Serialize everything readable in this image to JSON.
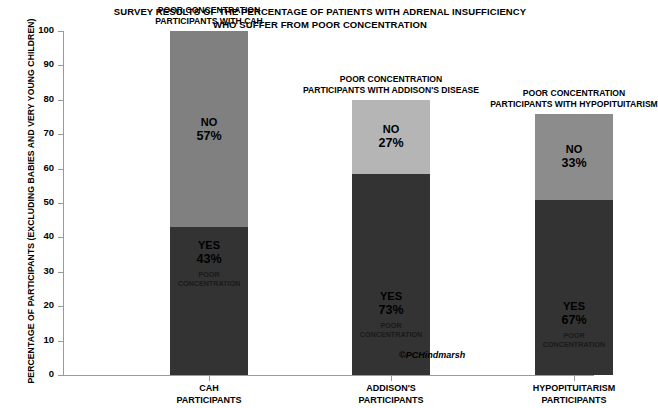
{
  "title": {
    "line1": "SURVEY RESULTS OF THE PERCENTAGE OF PATIENTS WITH ADRENAL INSUFFICIENCY",
    "line2": "WHO SUFFER FROM POOR CONCENTRATION"
  },
  "credit": "©PCHindmarsh",
  "colors": {
    "no_bar_1": "#808080",
    "no_bar_2": "#b5b5b5",
    "no_bar_3": "#8c8c8c",
    "yes_bar": "#333333",
    "axis": "#9a9a9a",
    "text": "#000000",
    "background": "#ffffff"
  },
  "chart_data": {
    "type": "bar",
    "title": "SURVEY RESULTS OF THE PERCENTAGE OF PATIENTS WITH ADRENAL INSUFFICIENCY WHO SUFFER FROM POOR CONCENTRATION",
    "xlabel": "",
    "ylabel": "PERCENTAGE OF PARTICIPANTS (EXCLUDING BABIES AND VERY YOUNG CHILDREN)",
    "ylim": [
      0,
      100
    ],
    "yticks": [
      0,
      10,
      20,
      30,
      40,
      50,
      60,
      70,
      80,
      90,
      100
    ],
    "grid": false,
    "legend": "none",
    "stacked": true,
    "categories": [
      "CAH PARTICIPANTS",
      "ADDISON'S PARTICIPANTS",
      "HYPOPITUITARISM PARTICIPANTS"
    ],
    "series": [
      {
        "name": "YES",
        "values": [
          43,
          73,
          67
        ]
      },
      {
        "name": "NO",
        "values": [
          57,
          27,
          33
        ]
      }
    ],
    "bars": [
      {
        "category_line1": "CAH",
        "category_line2": "PARTICIPANTS",
        "caption_line1": "POOR CONCENTRATION",
        "caption_line2": "PARTICIPANTS WITH CAH",
        "yes_label": "YES",
        "yes_value": "43%",
        "yes_pct": 43,
        "no_label": "NO",
        "no_value": "57%",
        "no_pct": 57,
        "sub_line1": "POOR",
        "sub_line2": "CONCENTRATION",
        "total_top": 100,
        "left_px": 107,
        "width_px": 78,
        "no_color": "#808080"
      },
      {
        "category_line1": "ADDISON'S",
        "category_line2": "PARTICIPANTS",
        "caption_line1": "POOR CONCENTRATION",
        "caption_line2": "PARTICIPANTS WITH ADDISON'S DISEASE",
        "yes_label": "YES",
        "yes_value": "73%",
        "yes_pct": 73,
        "no_label": "NO",
        "no_value": "27%",
        "no_pct": 27,
        "sub_line1": "POOR",
        "sub_line2": "CONCENTRATION",
        "total_top": 100,
        "left_px": 289,
        "width_px": 78,
        "no_color": "#b5b5b5"
      },
      {
        "category_line1": "HYPOPITUITARISM",
        "category_line2": "PARTICIPANTS",
        "caption_line1": "POOR CONCENTRATION",
        "caption_line2": "PARTICIPANTS WITH HYPOPITUITARISM",
        "yes_label": "YES",
        "yes_value": "67%",
        "yes_pct": 67,
        "no_label": "NO",
        "no_value": "33%",
        "no_pct": 33,
        "sub_line1": "POOR",
        "sub_line2": "CONCENTRATION",
        "total_top": 100,
        "left_px": 472,
        "width_px": 78,
        "no_color": "#8c8c8c"
      }
    ],
    "bar_totals_pct": [
      100,
      80,
      76
    ]
  }
}
